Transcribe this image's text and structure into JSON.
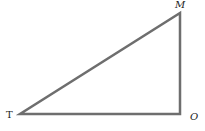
{
  "diagram": {
    "type": "right-triangle",
    "stroke_color": "#6e6e6e",
    "vertices": [
      {
        "id": "T",
        "label": "T",
        "x": 20,
        "y": 114,
        "label_x": 6,
        "label_y": 118,
        "italic": false
      },
      {
        "id": "O",
        "label": "O",
        "x": 180,
        "y": 114,
        "label_x": 190,
        "label_y": 120,
        "italic": true
      },
      {
        "id": "M",
        "label": "M",
        "x": 180,
        "y": 13,
        "label_x": 175,
        "label_y": 8,
        "italic": true
      }
    ],
    "right_angle_at": "O"
  }
}
